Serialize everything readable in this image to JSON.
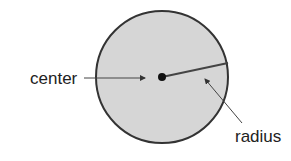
{
  "diagram": {
    "labels": {
      "center": "center",
      "radius": "radius"
    },
    "colors": {
      "circle_fill": "#d6d6d6",
      "circle_stroke": "#333333",
      "arrow": "#444444"
    }
  }
}
